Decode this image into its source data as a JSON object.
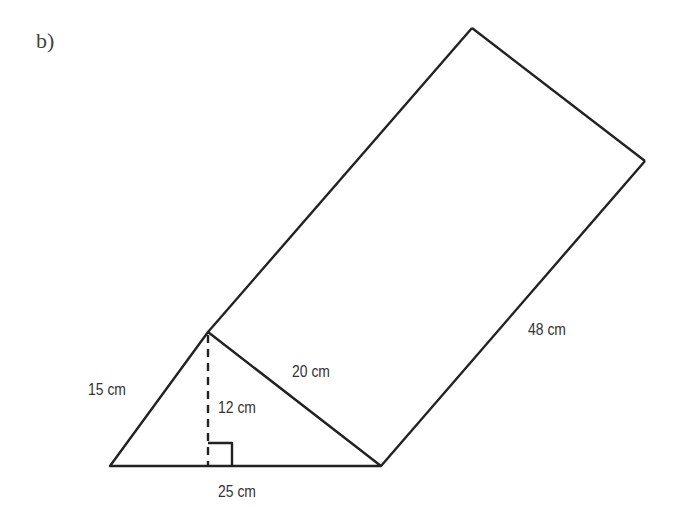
{
  "part_label": "b)",
  "figure": {
    "type": "triangular prism",
    "labels": {
      "left_side": "15 cm",
      "right_side": "20 cm",
      "height": "12 cm",
      "base": "25 cm",
      "length": "48 cm"
    },
    "stroke_color": "#222222"
  }
}
